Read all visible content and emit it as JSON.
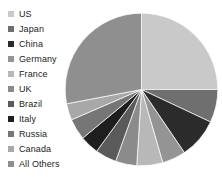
{
  "chart_data": {
    "type": "pie",
    "title": "",
    "xlabel": "",
    "ylabel": "",
    "legend_position": "left",
    "grid": false,
    "start_angle_deg": 0,
    "direction": "clockwise",
    "categories": [
      "US",
      "Japan",
      "China",
      "Germany",
      "France",
      "UK",
      "Brazil",
      "Italy",
      "Russia",
      "Canada",
      "All Others"
    ],
    "values": [
      25.0,
      7.0,
      8.5,
      5.0,
      5.5,
      4.5,
      4.5,
      4.0,
      4.5,
      3.5,
      28.0
    ],
    "colors": [
      "#c9c9c9",
      "#6f6f6f",
      "#2b2b2b",
      "#949494",
      "#b8b8b8",
      "#8b8b8b",
      "#5a5a5a",
      "#1e1e1e",
      "#767676",
      "#a8a8a8",
      "#8f8f8f"
    ],
    "slices": [
      {
        "label": "US",
        "value": 25.0,
        "color": "#c9c9c9",
        "start_deg": 0.0,
        "end_deg": 90.0
      },
      {
        "label": "Japan",
        "value": 7.0,
        "color": "#6f6f6f",
        "start_deg": 90.0,
        "end_deg": 115.2
      },
      {
        "label": "China",
        "value": 8.5,
        "color": "#2b2b2b",
        "start_deg": 115.2,
        "end_deg": 145.8
      },
      {
        "label": "Germany",
        "value": 5.0,
        "color": "#949494",
        "start_deg": 145.8,
        "end_deg": 163.8
      },
      {
        "label": "France",
        "value": 5.5,
        "color": "#b8b8b8",
        "start_deg": 163.8,
        "end_deg": 183.6
      },
      {
        "label": "UK",
        "value": 4.5,
        "color": "#8b8b8b",
        "start_deg": 183.6,
        "end_deg": 199.8
      },
      {
        "label": "Brazil",
        "value": 4.5,
        "color": "#5a5a5a",
        "start_deg": 199.8,
        "end_deg": 216.0
      },
      {
        "label": "Italy",
        "value": 4.0,
        "color": "#1e1e1e",
        "start_deg": 216.0,
        "end_deg": 230.4
      },
      {
        "label": "Russia",
        "value": 4.5,
        "color": "#767676",
        "start_deg": 230.4,
        "end_deg": 246.6
      },
      {
        "label": "Canada",
        "value": 3.5,
        "color": "#a8a8a8",
        "start_deg": 246.6,
        "end_deg": 259.2
      },
      {
        "label": "All Others",
        "value": 28.0,
        "color": "#8f8f8f",
        "start_deg": 259.2,
        "end_deg": 360.0
      }
    ]
  },
  "legend": {
    "items": [
      {
        "label": "US",
        "color": "#c9c9c9"
      },
      {
        "label": "Japan",
        "color": "#6f6f6f"
      },
      {
        "label": "China",
        "color": "#2b2b2b"
      },
      {
        "label": "Germany",
        "color": "#949494"
      },
      {
        "label": "France",
        "color": "#b8b8b8"
      },
      {
        "label": "UK",
        "color": "#8b8b8b"
      },
      {
        "label": "Brazil",
        "color": "#5a5a5a"
      },
      {
        "label": "Italy",
        "color": "#1e1e1e"
      },
      {
        "label": "Russia",
        "color": "#767676"
      },
      {
        "label": "Canada",
        "color": "#a8a8a8"
      },
      {
        "label": "All Others",
        "color": "#8f8f8f"
      }
    ]
  }
}
